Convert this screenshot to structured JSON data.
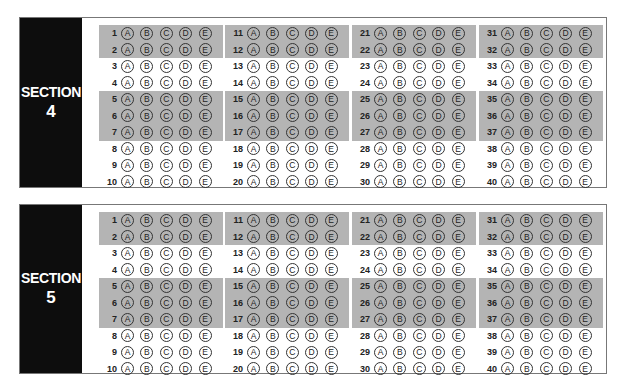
{
  "choices": [
    "A",
    "B",
    "C",
    "D",
    "E"
  ],
  "shaded_groups": [
    [
      1,
      2
    ],
    [
      5,
      6,
      7
    ]
  ],
  "sections": [
    {
      "label": "SECTION",
      "number": "4",
      "top": 17,
      "height": 171
    },
    {
      "label": "SECTION",
      "number": "5",
      "top": 204,
      "height": 170
    }
  ],
  "columns": [
    {
      "start": 1,
      "end": 10,
      "left": 79
    },
    {
      "start": 11,
      "end": 20,
      "left": 205
    },
    {
      "start": 21,
      "end": 30,
      "left": 332
    },
    {
      "start": 31,
      "end": 40,
      "left": 459
    }
  ],
  "colors": {
    "sidebar": "#0d0d0d",
    "shade": "#b4b4b4",
    "border": "#777777"
  }
}
